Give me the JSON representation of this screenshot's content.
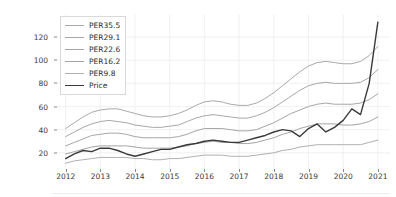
{
  "cell": {
    "out_label": "Out"
  },
  "chart_data": {
    "type": "line",
    "title": "",
    "xlabel": "",
    "ylabel": "",
    "xlim": [
      2011.75,
      2021.35
    ],
    "ylim": [
      6,
      140
    ],
    "grid": true,
    "legend_position": "upper left",
    "xticks": [
      "2012",
      "2013",
      "2014",
      "2015",
      "2016",
      "2017",
      "2018",
      "2019",
      "2020",
      "2021"
    ],
    "xtick_values": [
      2012,
      2013,
      2014,
      2015,
      2016,
      2017,
      2018,
      2019,
      2020,
      2021
    ],
    "yticks": [
      "20",
      "40",
      "60",
      "80",
      "100",
      "120"
    ],
    "ytick_values": [
      20,
      40,
      60,
      80,
      100,
      120
    ],
    "x": [
      2012.0,
      2012.25,
      2012.5,
      2012.75,
      2013.0,
      2013.25,
      2013.5,
      2013.75,
      2014.0,
      2014.25,
      2014.5,
      2014.75,
      2015.0,
      2015.25,
      2015.5,
      2015.75,
      2016.0,
      2016.25,
      2016.5,
      2016.75,
      2017.0,
      2017.25,
      2017.5,
      2017.75,
      2018.0,
      2018.25,
      2018.5,
      2018.75,
      2019.0,
      2019.25,
      2019.5,
      2019.75,
      2020.0,
      2020.25,
      2020.5,
      2020.75,
      2021.0
    ],
    "series": [
      {
        "name": "PER35.5",
        "color": "#aaaaaa",
        "width": 1.0,
        "values": [
          41,
          46,
          51,
          55,
          57,
          58,
          58,
          56,
          54,
          52,
          51,
          51,
          52,
          54,
          57,
          61,
          64,
          65,
          64,
          62,
          61,
          61,
          63,
          67,
          72,
          78,
          84,
          90,
          95,
          98,
          99,
          98,
          97,
          97,
          99,
          104,
          112
        ]
      },
      {
        "name": "PER29.1",
        "color": "#a8a8a8",
        "width": 1.0,
        "values": [
          34,
          38,
          42,
          45,
          47,
          48,
          47,
          46,
          44,
          43,
          42,
          42,
          43,
          44,
          47,
          50,
          52,
          53,
          52,
          51,
          50,
          50,
          52,
          55,
          59,
          64,
          69,
          74,
          78,
          80,
          81,
          80,
          80,
          80,
          81,
          85,
          92
        ]
      },
      {
        "name": "PER22.6",
        "color": "#a6a6a6",
        "width": 1.0,
        "values": [
          26,
          29,
          32,
          35,
          36,
          37,
          37,
          36,
          34,
          33,
          33,
          33,
          33,
          34,
          36,
          39,
          41,
          41,
          41,
          40,
          39,
          39,
          40,
          43,
          46,
          50,
          54,
          57,
          60,
          62,
          63,
          62,
          62,
          62,
          63,
          66,
          71
        ]
      },
      {
        "name": "PER16.2",
        "color": "#a4a4a4",
        "width": 1.0,
        "values": [
          19,
          21,
          23,
          25,
          26,
          26,
          26,
          26,
          25,
          24,
          24,
          24,
          24,
          25,
          26,
          28,
          29,
          30,
          29,
          29,
          28,
          28,
          29,
          31,
          33,
          36,
          38,
          41,
          43,
          45,
          45,
          45,
          44,
          44,
          45,
          47,
          51
        ]
      },
      {
        "name": "PER9.8",
        "color": "#b0b0b0",
        "width": 1.0,
        "values": [
          11,
          13,
          14,
          15,
          16,
          16,
          16,
          16,
          15,
          15,
          14,
          14,
          15,
          15,
          16,
          17,
          18,
          18,
          18,
          17,
          17,
          17,
          18,
          19,
          20,
          22,
          23,
          25,
          26,
          27,
          27,
          27,
          27,
          27,
          27,
          29,
          31
        ]
      },
      {
        "name": "Price",
        "color": "#3a3a3a",
        "width": 1.4,
        "values": [
          15,
          19,
          22,
          21,
          24,
          24,
          22,
          19,
          17,
          19,
          21,
          23,
          23,
          25,
          27,
          28,
          30,
          31,
          30,
          29,
          29,
          31,
          33,
          35,
          38,
          40,
          39,
          34,
          41,
          45,
          38,
          42,
          48,
          58,
          53,
          80,
          133
        ]
      }
    ]
  }
}
